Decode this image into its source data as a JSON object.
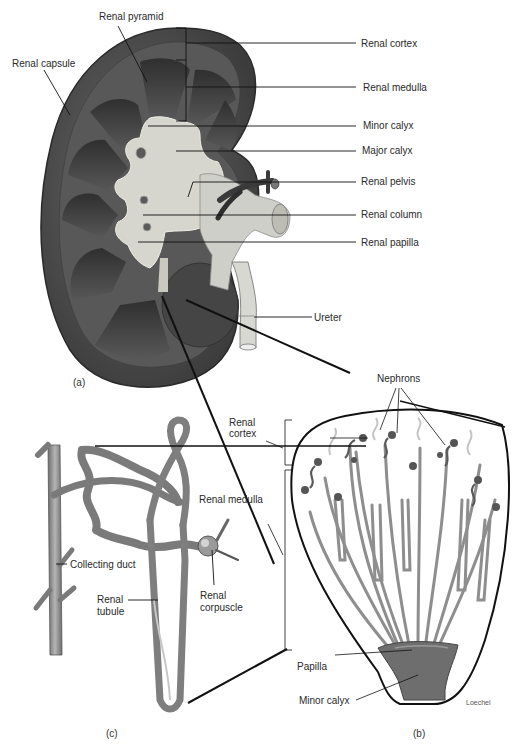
{
  "figure": {
    "panels": {
      "a": "(a)",
      "b": "(b)",
      "c": "(c)"
    },
    "kidney_labels": {
      "renal_pyramid": "Renal pyramid",
      "renal_capsule": "Renal capsule",
      "renal_cortex": "Renal cortex",
      "renal_medulla": "Renal medulla",
      "minor_calyx": "Minor calyx",
      "major_calyx": "Major calyx",
      "renal_pelvis": "Renal pelvis",
      "renal_column": "Renal column",
      "renal_papilla": "Renal papilla",
      "ureter": "Ureter"
    },
    "pyramid_labels": {
      "nephrons": "Nephrons",
      "renal_cortex_line1": "Renal",
      "renal_cortex_line2": "cortex",
      "renal_medulla": "Renal medulla",
      "papilla": "Papilla",
      "minor_calyx": "Minor calyx",
      "artist": "Loechel"
    },
    "nephron_labels": {
      "collecting_duct": "Collecting duct",
      "renal_tubule_line1": "Renal",
      "renal_tubule_line2": "tubule",
      "renal_corpuscle_line1": "Renal",
      "renal_corpuscle_line2": "corpuscle"
    },
    "colors": {
      "kidney_dark": "#4a4a4a",
      "kidney_mid": "#6e6e6e",
      "calyx_light": "#d8d8d0",
      "tubule": "#8a8a8a",
      "line": "#111111"
    }
  }
}
